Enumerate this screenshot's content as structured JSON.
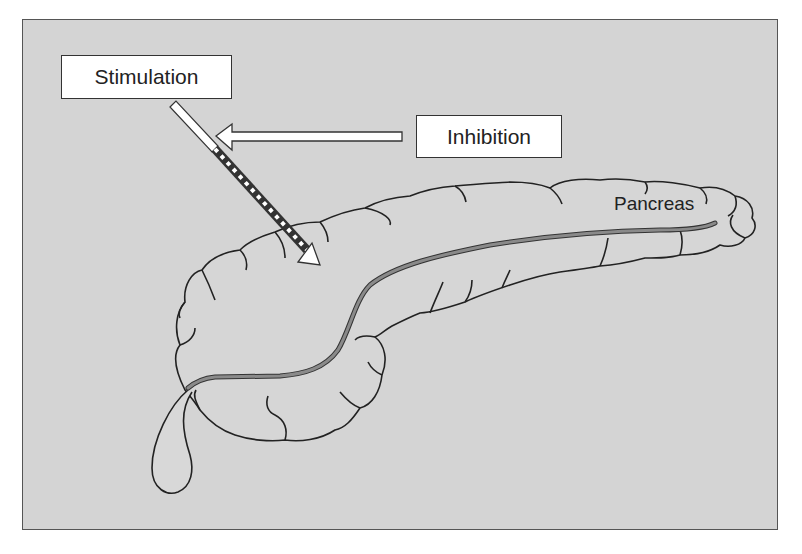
{
  "diagram": {
    "labels": {
      "stimulation": "Stimulation",
      "inhibition": "Inhibition",
      "organ": "Pancreas"
    },
    "colors": {
      "background": "#d4d4d4",
      "outline": "#222222",
      "duct": "#8a8a8a",
      "box_fill": "#ffffff"
    },
    "arrows": [
      {
        "name": "stimulation-arrow",
        "from": "Stimulation",
        "to": "Pancreas",
        "style": "white then black-white dashed diagonal"
      },
      {
        "name": "inhibition-arrow",
        "from": "Inhibition",
        "to": "stimulation-arrow",
        "style": "hollow white horizontal"
      }
    ]
  }
}
